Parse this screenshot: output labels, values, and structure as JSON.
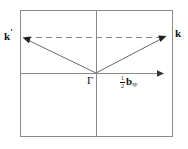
{
  "figure": {
    "background_color": "#ffffff",
    "line_color": "#808080",
    "vector_color": "#555555",
    "text_color": "#111111",
    "labels": {
      "k_prime": "k",
      "k_prime_mark": "'",
      "k": "k",
      "gamma": "Γ",
      "b_numerator": "1",
      "b_denominator": "2",
      "b_symbol": "b",
      "b_subscript": "xy"
    },
    "geometry": {
      "rect": {
        "x1": 20,
        "y1": 10,
        "x2": 173,
        "y2": 137
      },
      "vertical_axis_x": 96,
      "horizontal_axis_y": 73,
      "horizontal_axis_arrow_end_x": 164,
      "dashed_line_y": 37,
      "dashed_line_x1": 24,
      "dashed_line_x2": 166,
      "origin": {
        "x": 96,
        "y": 73
      },
      "k_prime_point": {
        "x": 23,
        "y": 38
      },
      "k_point": {
        "x": 166,
        "y": 36
      }
    }
  }
}
